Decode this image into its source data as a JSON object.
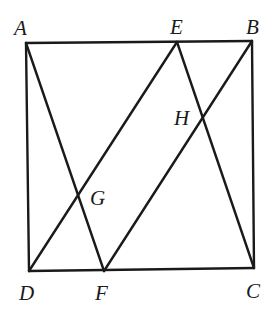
{
  "figure": {
    "type": "geometry"
  },
  "points": {
    "A": {
      "label": "A",
      "x": 26,
      "y": 43,
      "label_x": 14,
      "label_y": 35
    },
    "E": {
      "label": "E",
      "x": 177,
      "y": 42,
      "label_x": 170,
      "label_y": 34
    },
    "B": {
      "label": "B",
      "x": 252,
      "y": 41,
      "label_x": 246,
      "label_y": 34
    },
    "D": {
      "label": "D",
      "x": 29,
      "y": 271,
      "label_x": 19,
      "label_y": 300
    },
    "F": {
      "label": "F",
      "x": 104,
      "y": 271,
      "label_x": 95,
      "label_y": 300
    },
    "C": {
      "label": "C",
      "x": 254,
      "y": 268,
      "label_x": 246,
      "label_y": 298
    },
    "G": {
      "label": "G",
      "x": 77,
      "y": 197,
      "label_x": 90,
      "label_y": 205
    },
    "H": {
      "label": "H",
      "x": 203,
      "y": 118,
      "label_x": 174,
      "label_y": 125
    }
  },
  "segments": [
    {
      "name": "AB",
      "from": "A",
      "to": "B"
    },
    {
      "name": "BC",
      "from": "B",
      "to": "C"
    },
    {
      "name": "CD",
      "from": "C",
      "to": "D"
    },
    {
      "name": "DA",
      "from": "D",
      "to": "A"
    },
    {
      "name": "AF",
      "from": "A",
      "to": "F"
    },
    {
      "name": "DE",
      "from": "D",
      "to": "E"
    },
    {
      "name": "EC",
      "from": "E",
      "to": "C"
    },
    {
      "name": "FB",
      "from": "F",
      "to": "B"
    }
  ],
  "labels": {
    "A": "A",
    "B": "B",
    "C": "C",
    "D": "D",
    "E": "E",
    "F": "F",
    "G": "G",
    "H": "H"
  },
  "colors": {
    "line": "#1a1a1a",
    "background": "#ffffff"
  }
}
